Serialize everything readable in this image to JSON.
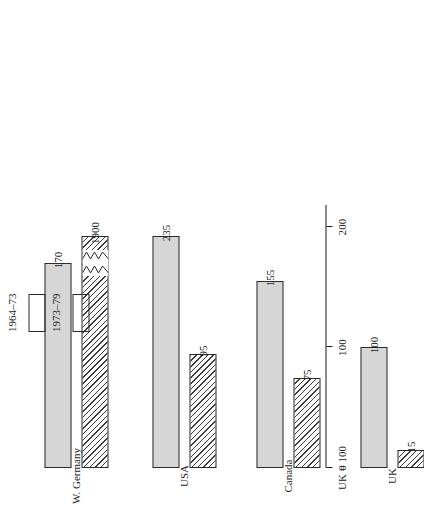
{
  "chart_data": {
    "type": "bar",
    "title": "",
    "subtitle": "",
    "orientation": "vertical-grouped",
    "xlabel": "",
    "ylabel": "UK = 100",
    "axis_title": "UK = 100",
    "ylim": [
      0,
      220
    ],
    "yticks": [
      0,
      100,
      200
    ],
    "ytick_labels": [
      "0",
      "100",
      "200"
    ],
    "grid": false,
    "legend_position": "upper-left",
    "categories": [
      "W. Germany",
      "USA",
      "Canada",
      "UK"
    ],
    "series": [
      {
        "name": "1964–73",
        "fill": "solid-gray",
        "values": [
          170,
          235,
          155,
          100
        ],
        "labels": [
          "170",
          "235",
          "155",
          "100"
        ],
        "clipped": []
      },
      {
        "name": "1973–79",
        "fill": "diagonal-hatch",
        "values": [
          1900,
          95,
          75,
          15
        ],
        "labels": [
          "1900",
          "95",
          "75",
          "15"
        ],
        "clipped": [
          "W. Germany"
        ],
        "clip_note": "W. Germany bar is broken (axis break) because 1900 exceeds the scale"
      }
    ],
    "annotations": [
      {
        "text": "1900",
        "series": "1973–79",
        "category": "W. Germany",
        "kind": "broken-bar-value"
      }
    ]
  },
  "axis": {
    "title": "UK = 100",
    "ticks": [
      {
        "label": "0",
        "value": 0
      },
      {
        "label": "100",
        "value": 100
      },
      {
        "label": "200",
        "value": 200
      }
    ]
  },
  "categories": [
    {
      "label": "W. Germany"
    },
    {
      "label": "USA"
    },
    {
      "label": "Canada"
    },
    {
      "label": "UK"
    }
  ],
  "legend": {
    "entries": [
      {
        "label": "1964–73",
        "fill": "solid-gray"
      },
      {
        "label": "1973–79",
        "fill": "diagonal-hatch"
      }
    ]
  },
  "bars": [
    {
      "category": "W. Germany",
      "series": "1964–73",
      "value": 170,
      "label": "170"
    },
    {
      "category": "W. Germany",
      "series": "1973–79",
      "value": 1900,
      "label": "1900"
    },
    {
      "category": "USA",
      "series": "1964–73",
      "value": 235,
      "label": "235"
    },
    {
      "category": "USA",
      "series": "1973–79",
      "value": 95,
      "label": "95"
    },
    {
      "category": "Canada",
      "series": "1964–73",
      "value": 155,
      "label": "155"
    },
    {
      "category": "Canada",
      "series": "1973–79",
      "value": 75,
      "label": "75"
    },
    {
      "category": "UK",
      "series": "1964–73",
      "value": 100,
      "label": "100"
    },
    {
      "category": "UK",
      "series": "1973–79",
      "value": 15,
      "label": "15"
    }
  ],
  "colors": {
    "series_1_fill": "#d6d6d6",
    "series_2_fill": "#fbfbfb",
    "hatch": "#3a3a3a",
    "outline": "#2b2b2b",
    "axis": "#1a1a1a",
    "background": "#ffffff"
  }
}
